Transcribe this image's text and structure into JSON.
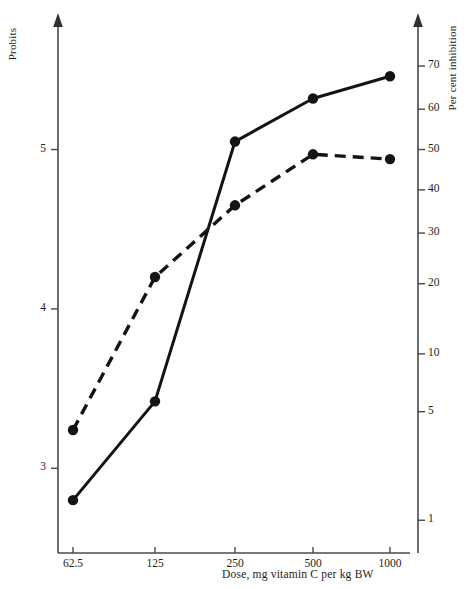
{
  "chart_data": {
    "type": "line",
    "title": "",
    "xlabel": "Dose, mg vitamin C per kg BW",
    "ylabel": "Probits",
    "y2label": "Per cent  inhibition",
    "grid": false,
    "legend_position": "none",
    "x_scale": "log2",
    "categories": [
      "62.5",
      "125",
      "250",
      "500",
      "1000"
    ],
    "x_tick_labels": [
      "62.5",
      "125",
      "250",
      "500",
      "1000"
    ],
    "y_tick_labels": [
      "3",
      "4",
      "5"
    ],
    "y_tick_values": [
      3,
      4,
      5
    ],
    "ylim": [
      2.55,
      5.75
    ],
    "y2_tick_labels": [
      "1",
      "5",
      "10",
      "20",
      "30",
      "40",
      "50",
      "60",
      "70"
    ],
    "y2_tick_values": [
      1,
      5,
      10,
      20,
      30,
      40,
      50,
      60,
      70
    ],
    "y2_tick_probits": [
      2.674,
      3.355,
      3.718,
      4.158,
      4.476,
      4.747,
      5.0,
      5.253,
      5.524
    ],
    "series": [
      {
        "name": "series-solid",
        "style": "solid",
        "marker": "filled-circle",
        "color": "#141414",
        "values": [
          2.8,
          3.42,
          5.05,
          5.32,
          5.46
        ]
      },
      {
        "name": "series-dashed",
        "style": "dashed",
        "marker": "filled-circle",
        "color": "#141414",
        "values": [
          3.24,
          4.2,
          4.65,
          4.97,
          4.94
        ]
      }
    ]
  },
  "axes": {
    "left_title": "Probits",
    "right_title": "Per cent  inhibition",
    "bottom_title": "Dose, mg vitamin C per kg BW"
  },
  "colors": {
    "axis": "#4a4a4a",
    "data": "#141414",
    "background": "#ffffff"
  }
}
